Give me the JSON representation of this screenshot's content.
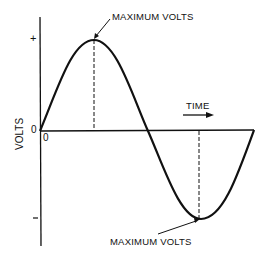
{
  "diagram": {
    "y_axis_label": "VOLTS",
    "x_axis_label": "TIME",
    "plus_label": "+",
    "minus_label": "–",
    "origin_y_label": "0",
    "origin_x_label": "0",
    "peak_label": "MAXIMUM VOLTS",
    "trough_label": "MAXIMUM VOLTS"
  }
}
